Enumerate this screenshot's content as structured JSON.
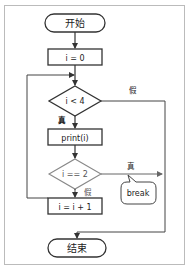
{
  "flowchart": {
    "start": "开始",
    "init": "i = 0",
    "cond1": "i < 4",
    "cond1_false": "假",
    "cond1_true": "真",
    "body": "print(i)",
    "cond2": "i == 2",
    "cond2_true": "真",
    "cond2_false": "假",
    "break_label": "break",
    "increment": "i = i + 1",
    "end": "结束"
  },
  "colors": {
    "stroke": "#333333",
    "highlight_stroke": "#888888",
    "frame": "#bbbbbb"
  }
}
